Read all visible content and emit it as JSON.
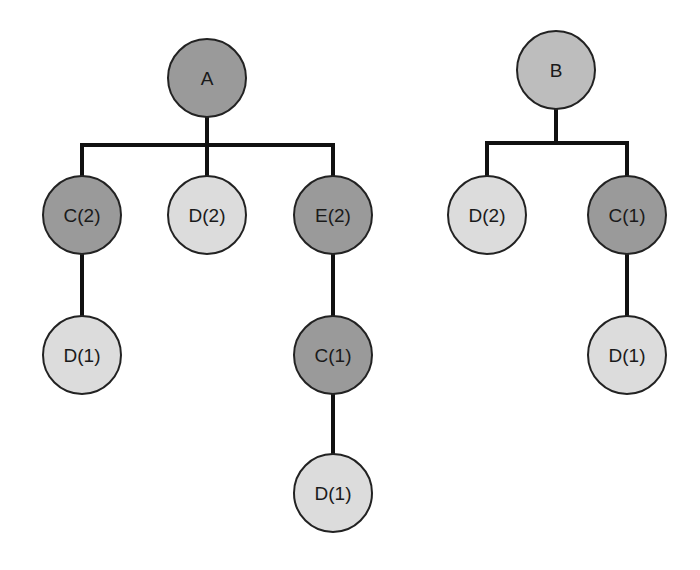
{
  "colors": {
    "dark": "#9a9a9a",
    "medium": "#bdbdbd",
    "light": "#dcdcdc",
    "stroke": "#222222",
    "edge": "#111111"
  },
  "trees": [
    {
      "root": "A",
      "nodes": [
        {
          "id": "A",
          "label": "A",
          "x": 207,
          "y": 78,
          "shade": "dark"
        },
        {
          "id": "A_C2",
          "label": "C(2)",
          "x": 82,
          "y": 215,
          "shade": "dark"
        },
        {
          "id": "A_D2",
          "label": "D(2)",
          "x": 207,
          "y": 215,
          "shade": "light"
        },
        {
          "id": "A_E2",
          "label": "E(2)",
          "x": 333,
          "y": 215,
          "shade": "dark"
        },
        {
          "id": "A_C2_D1",
          "label": "D(1)",
          "x": 82,
          "y": 355,
          "shade": "light"
        },
        {
          "id": "A_E2_C1",
          "label": "C(1)",
          "x": 333,
          "y": 355,
          "shade": "dark"
        },
        {
          "id": "A_E2_C1_D1",
          "label": "D(1)",
          "x": 333,
          "y": 493,
          "shade": "light"
        }
      ]
    },
    {
      "root": "B",
      "nodes": [
        {
          "id": "B",
          "label": "B",
          "x": 556,
          "y": 70,
          "shade": "medium"
        },
        {
          "id": "B_D2",
          "label": "D(2)",
          "x": 487,
          "y": 215,
          "shade": "light"
        },
        {
          "id": "B_C1",
          "label": "C(1)",
          "x": 627,
          "y": 215,
          "shade": "dark"
        },
        {
          "id": "B_C1_D1",
          "label": "D(1)",
          "x": 627,
          "y": 355,
          "shade": "light"
        }
      ]
    }
  ],
  "node_radius": 39
}
